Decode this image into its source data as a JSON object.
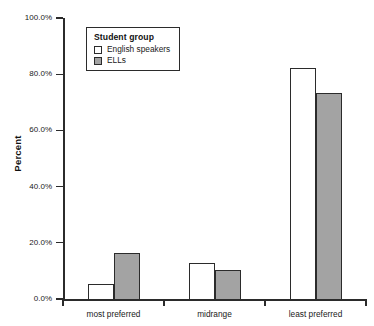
{
  "chart_data": {
    "type": "bar",
    "title": "",
    "subtitle": "",
    "xlabel": "",
    "ylabel": "Percent",
    "categories": [
      "most preferred",
      "midrange",
      "least preferred"
    ],
    "series": [
      {
        "name": "English speakers",
        "values": [
          5.2,
          12.7,
          82.2
        ],
        "color": "#ffffff"
      },
      {
        "name": "ELLs",
        "values": [
          16.4,
          10.3,
          73.2
        ],
        "color": "#a3a3a3"
      }
    ],
    "ylim": [
      0,
      100
    ],
    "ytick_values": [
      0,
      20,
      40,
      60,
      80,
      100
    ],
    "ytick_labels": [
      "0.0%",
      "20.0%",
      "40.0%",
      "60.0%",
      "80.0%",
      "100.0%"
    ],
    "grid": false,
    "legend": {
      "title": "Student group",
      "position": "upper-left-inside",
      "entries": [
        {
          "label": "English speakers",
          "swatch": "white"
        },
        {
          "label": "ELLs",
          "swatch": "gray"
        }
      ]
    },
    "axis_color": "#2b2b2b",
    "bar_edge_color": "#2b2b2b",
    "background": "#ffffff"
  }
}
